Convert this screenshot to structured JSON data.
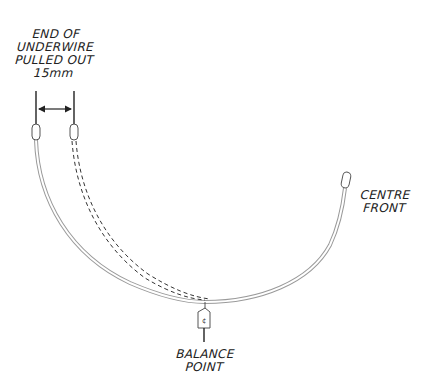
{
  "diagram": {
    "type": "underwire-balance-diagram",
    "colors": {
      "ink": "#222222",
      "wire_outline": "#9a9a9a",
      "wire_fill": "#ffffff",
      "background": "#ffffff"
    },
    "labels": {
      "end_of_underwire": {
        "lines": [
          "END OF",
          "UNDERWIRE",
          "PULLED OUT",
          "15mm"
        ]
      },
      "centre_front": {
        "lines": [
          "CENTRE",
          "FRONT"
        ]
      },
      "balance_point": {
        "lines": [
          "BALANCE",
          "POINT"
        ]
      }
    },
    "measurement": {
      "value": "15mm",
      "indicator": "double-headed-arrow"
    },
    "elements": [
      {
        "name": "underwire-original",
        "style": "solid"
      },
      {
        "name": "underwire-pulled-out",
        "style": "dashed"
      },
      {
        "name": "balance-point-tag",
        "style": "hanging-tag"
      }
    ]
  }
}
